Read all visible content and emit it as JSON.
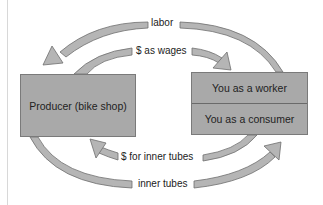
{
  "diagram": {
    "type": "circular-flow",
    "nodes": {
      "producer": {
        "label": "Producer (bike shop)"
      },
      "household": {
        "worker_label": "You as a worker",
        "consumer_label": "You as a consumer"
      }
    },
    "flows": [
      {
        "id": "labor",
        "label": "labor",
        "from": "You as a worker",
        "to": "Producer (bike shop)"
      },
      {
        "id": "wages",
        "label": "$ as wages",
        "from": "Producer (bike shop)",
        "to": "You as a worker"
      },
      {
        "id": "money_for_tubes",
        "label": "$ for inner tubes",
        "from": "You as a consumer",
        "to": "Producer (bike shop)"
      },
      {
        "id": "inner_tubes",
        "label": "inner tubes",
        "from": "Producer (bike shop)",
        "to": "You as a consumer"
      }
    ],
    "colors": {
      "box_fill": "#a9a9a9",
      "arrow_fill": "#b5b5b5",
      "outline": "#6e6e6e",
      "background": "#ffffff"
    }
  }
}
